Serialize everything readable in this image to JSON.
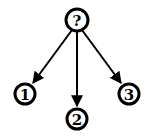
{
  "diagram": {
    "type": "tree",
    "root": {
      "label": "?",
      "cx": 77,
      "cy": 20
    },
    "children": [
      {
        "label": "1",
        "cx": 25,
        "cy": 94
      },
      {
        "label": "2",
        "cx": 77,
        "cy": 119
      },
      {
        "label": "3",
        "cx": 129,
        "cy": 94
      }
    ],
    "edges": [
      {
        "from": "?",
        "to": "1"
      },
      {
        "from": "?",
        "to": "2"
      },
      {
        "from": "?",
        "to": "3"
      }
    ],
    "colors": {
      "stroke": "#000000",
      "background": "#ffffff"
    }
  }
}
